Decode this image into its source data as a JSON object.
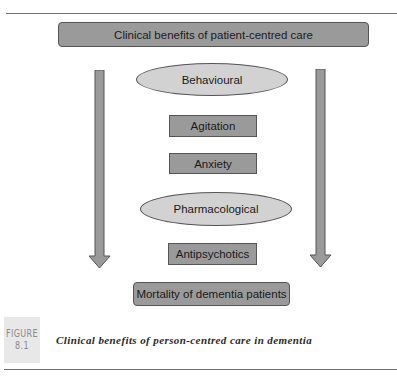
{
  "diagram": {
    "title": "Clinical benefits of patient-centred care",
    "categories": [
      {
        "label": "Behavioural",
        "items": [
          "Agitation",
          "Anxiety"
        ]
      },
      {
        "label": "Pharmacological",
        "items": [
          "Antipsychotics"
        ]
      }
    ],
    "outcome": "Mortality of dementia patients",
    "arrows": {
      "left": "down-arrow",
      "right": "down-arrow"
    },
    "colors": {
      "box_fill": "#9a9a9a",
      "ellipse_fill": "#d2d2d2",
      "border": "#555555",
      "arrow_fill": "#9a9a9a"
    }
  },
  "figure": {
    "label_word": "FIGURE",
    "label_number": "8.1",
    "caption": "Clinical benefits of person-centred care in dementia"
  }
}
